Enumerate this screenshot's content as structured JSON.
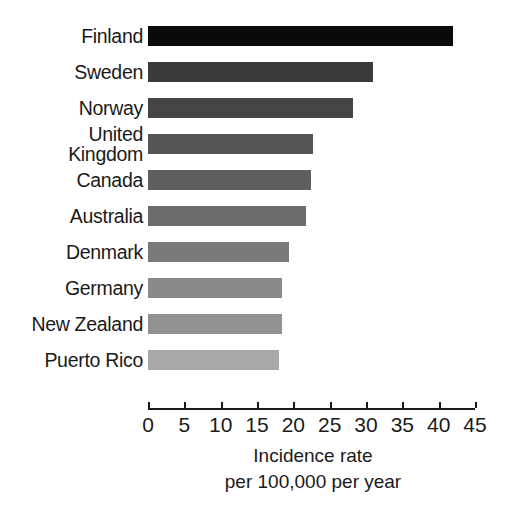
{
  "chart_data": {
    "type": "bar",
    "orientation": "horizontal",
    "title": "",
    "xlabel": "Incidence rate per 100,000 per year",
    "ylabel": "",
    "xlim": [
      0,
      45
    ],
    "grid": false,
    "legend": false,
    "categories": [
      "Finland",
      "Sweden",
      "Norway",
      "United\nKingdom",
      "Canada",
      "Australia",
      "Denmark",
      "Germany",
      "New Zealand",
      "Puerto Rico"
    ],
    "values": [
      42.0,
      31.0,
      28.2,
      22.7,
      22.4,
      21.7,
      19.4,
      18.4,
      18.4,
      18.0
    ],
    "bar_colors": [
      "#0a0a0a",
      "#3a3a3a",
      "#454545",
      "#555555",
      "#5e5e5e",
      "#6b6b6b",
      "#7a7a7a",
      "#8a8a8a",
      "#929292",
      "#a8a8a8"
    ],
    "xticks": [
      0,
      5,
      10,
      15,
      20,
      25,
      30,
      35,
      40,
      45
    ],
    "xticklabels": [
      "0",
      "5",
      "10",
      "15",
      "20",
      "25",
      "30",
      "35",
      "40",
      "45"
    ]
  },
  "axis_title": {
    "line1": "Incidence rate",
    "line2": "per 100,000 per year"
  }
}
